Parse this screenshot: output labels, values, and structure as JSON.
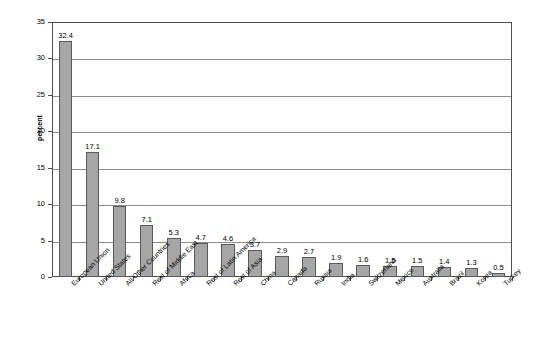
{
  "chart_data": {
    "type": "bar",
    "title": "",
    "xlabel": "",
    "ylabel": "percent",
    "ylim": [
      0,
      35
    ],
    "ytick_values": [
      0,
      5,
      10,
      15,
      20,
      25,
      30,
      35
    ],
    "ytick_labels": [
      "0",
      "5",
      "10",
      "15",
      "20",
      "25",
      "30",
      "35"
    ],
    "grid": true,
    "legend": "none",
    "bar_color": "#a6a6a6",
    "bar_edge_color": "#595959",
    "categories": [
      "European Union",
      "United States",
      "All Other Countries",
      "Rest of Middle East",
      "Africa",
      "Rest of Latin America",
      "Rest of Asia",
      "China",
      "Canada",
      "Russia",
      "India",
      "Switzerland",
      "Mexico",
      "Australia",
      "Brazil",
      "Korea",
      "Turkey"
    ],
    "values": [
      32.4,
      17.1,
      9.8,
      7.1,
      5.3,
      4.7,
      4.6,
      3.7,
      2.9,
      2.7,
      1.9,
      1.6,
      1.5,
      1.5,
      1.4,
      1.3,
      0.5
    ],
    "value_labels": [
      "32.4",
      "17.1",
      "9.8",
      "7.1",
      "5.3",
      "4.7",
      "4.6",
      "3.7",
      "2.9",
      "2.7",
      "1.9",
      "1.6",
      "1.5",
      "1.5",
      "1.4",
      "1.3",
      "0.5"
    ]
  }
}
